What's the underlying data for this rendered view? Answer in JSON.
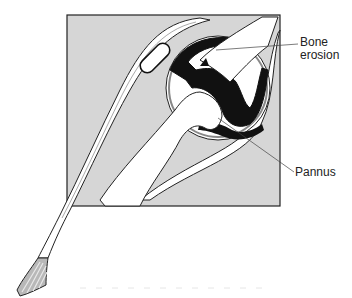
{
  "figure": {
    "type": "anatomical-diagram",
    "labels": {
      "bone_erosion": "Bone\nerosion",
      "bone_erosion_line1": "Bone",
      "bone_erosion_line2": "erosion",
      "pannus": "Pannus"
    },
    "colors": {
      "background": "#ffffff",
      "tissue_gray": "#d6d6d6",
      "bone_white": "#ffffff",
      "pannus_black": "#111111",
      "cartilage_gray": "#9a9a9a",
      "outline": "#222222"
    }
  }
}
